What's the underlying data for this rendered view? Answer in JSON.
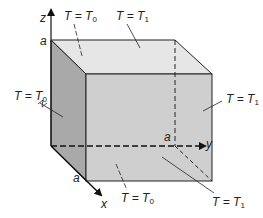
{
  "figure": {
    "type": "cube-heat-conduction",
    "axes": {
      "x_label": "x",
      "y_label": "y",
      "z_label": "z",
      "length_label": "a"
    },
    "boundary_labels": {
      "top_back": {
        "lhs": "T",
        "rhs": "T",
        "sub": "0"
      },
      "top": {
        "lhs": "T",
        "rhs": "T",
        "sub": "1"
      },
      "left": {
        "lhs": "T",
        "rhs": "T",
        "sub": "0"
      },
      "right": {
        "lhs": "T",
        "rhs": "T",
        "sub": "1"
      },
      "bottom": {
        "lhs": "T",
        "rhs": "T",
        "sub": "0"
      },
      "front_bottom_right": {
        "lhs": "T",
        "rhs": "T",
        "sub": "1"
      }
    },
    "colors": {
      "top_face": "#e6e6e6",
      "front_face": "#cfcfcf",
      "left_face": "#a9a9a9",
      "edge": "#222222"
    }
  }
}
